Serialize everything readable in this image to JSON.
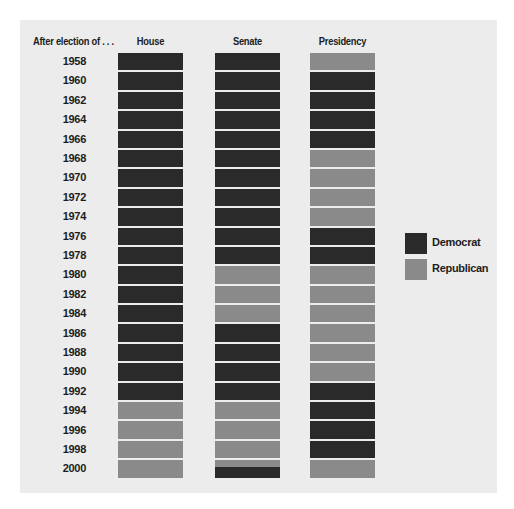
{
  "chart_data": {
    "type": "heatmap",
    "title": "",
    "row_header": "After election of . . .",
    "columns": [
      "House",
      "Senate",
      "Presidency"
    ],
    "categories": [
      "1958",
      "1960",
      "1962",
      "1964",
      "1966",
      "1968",
      "1970",
      "1972",
      "1974",
      "1976",
      "1978",
      "1980",
      "1982",
      "1984",
      "1986",
      "1988",
      "1990",
      "1992",
      "1994",
      "1996",
      "1998",
      "2000"
    ],
    "series": [
      {
        "name": "House",
        "values": [
          "D",
          "D",
          "D",
          "D",
          "D",
          "D",
          "D",
          "D",
          "D",
          "D",
          "D",
          "D",
          "D",
          "D",
          "D",
          "D",
          "D",
          "D",
          "R",
          "R",
          "R",
          "R"
        ]
      },
      {
        "name": "Senate",
        "values": [
          "D",
          "D",
          "D",
          "D",
          "D",
          "D",
          "D",
          "D",
          "D",
          "D",
          "D",
          "R",
          "R",
          "R",
          "D",
          "D",
          "D",
          "D",
          "R",
          "R",
          "R",
          "Split"
        ]
      },
      {
        "name": "Presidency",
        "values": [
          "R",
          "D",
          "D",
          "D",
          "D",
          "R",
          "R",
          "R",
          "R",
          "D",
          "D",
          "R",
          "R",
          "R",
          "R",
          "R",
          "R",
          "D",
          "D",
          "D",
          "D",
          "R"
        ]
      }
    ],
    "legend": [
      {
        "key": "D",
        "label": "Democrat",
        "color": "#2a2a2a"
      },
      {
        "key": "R",
        "label": "Republican",
        "color": "#8a8a8a"
      }
    ],
    "legend_position": "right"
  },
  "headers": {
    "row_label": "After election of . . .",
    "house": "House",
    "senate": "Senate",
    "presidency": "Presidency"
  },
  "legend": {
    "democrat": "Democrat",
    "republican": "Republican"
  },
  "colors": {
    "democrat": "#2a2a2a",
    "republican": "#8a8a8a",
    "background": "#ececec"
  }
}
